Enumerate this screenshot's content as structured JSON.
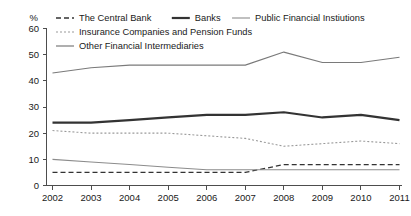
{
  "chart_data": {
    "type": "line",
    "title": "",
    "xlabel": "",
    "ylabel": "%",
    "unit_label": "%",
    "categories": [
      "2002",
      "2003",
      "2004",
      "2005",
      "2006",
      "2007",
      "2008",
      "2009",
      "2010",
      "2011"
    ],
    "x": [
      2002,
      2003,
      2004,
      2005,
      2006,
      2007,
      2008,
      2009,
      2010,
      2011
    ],
    "ylim": [
      0,
      60
    ],
    "yticks": [
      0,
      10,
      20,
      30,
      40,
      50,
      60
    ],
    "ytick_labels": [
      "0",
      "10",
      "20",
      "30",
      "40",
      "50",
      "60"
    ],
    "grid": false,
    "legend_position": "top",
    "series": [
      {
        "name": "The Central Bank",
        "style": "dashed",
        "color": "#333333",
        "width": 1.3,
        "values": [
          5,
          5,
          5,
          5,
          5,
          5,
          8,
          8,
          8,
          8
        ]
      },
      {
        "name": "Banks",
        "style": "solid-thick",
        "color": "#333333",
        "width": 2.2,
        "values": [
          24,
          24,
          25,
          26,
          27,
          27,
          28,
          26,
          27,
          25
        ]
      },
      {
        "name": "Public Financial Instiutions",
        "style": "solid-thin",
        "color": "#8c8c8c",
        "width": 1.1,
        "values": [
          10,
          9,
          8,
          7,
          6,
          6,
          6,
          6,
          6,
          6
        ]
      },
      {
        "name": "Insurance Companies and Pension Funds",
        "style": "dotted",
        "color": "#9a9a9a",
        "width": 1.1,
        "values": [
          21,
          20,
          20,
          20,
          19,
          18,
          15,
          16,
          17,
          16
        ]
      },
      {
        "name": "Other Financial Intermediaries",
        "style": "solid-thin-gray",
        "color": "#7a7a7a",
        "width": 1.2,
        "values": [
          43,
          45,
          46,
          46,
          46,
          46,
          51,
          47,
          47,
          49
        ]
      }
    ]
  },
  "legend": {
    "items": [
      {
        "label": "The Central Bank",
        "swatch": "dashed-swatch"
      },
      {
        "label": "Banks",
        "swatch": "solid-thick-swatch"
      },
      {
        "label": "Public Financial Instiutions",
        "swatch": "solid-thin-swatch"
      },
      {
        "label": "Insurance Companies and Pension Funds",
        "swatch": "dotted-swatch"
      },
      {
        "label": "Other Financial Intermediaries",
        "swatch": "solid-dark-swatch"
      }
    ]
  },
  "axes": {
    "y_unit": "%",
    "y_labels": [
      "60",
      "50",
      "40",
      "30",
      "20",
      "10",
      "0"
    ],
    "x_labels": [
      "2002",
      "2003",
      "2004",
      "2005",
      "2006",
      "2007",
      "2008",
      "2009",
      "2010",
      "2011"
    ]
  }
}
